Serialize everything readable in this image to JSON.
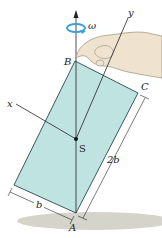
{
  "figure": {
    "labels": {
      "omega": "ω",
      "y_axis": "y",
      "x_axis": "x",
      "point_B": "B",
      "point_C": "C",
      "point_S": "S",
      "point_A": "A",
      "dim_short": "b",
      "dim_long": "2b"
    },
    "colors": {
      "plate_fill": "#bfe3e0",
      "plate_edge": "#3a5a5a",
      "shadow": "#c9c9bd",
      "hand": "#efe3cf",
      "rotation_arrow": "#3b9fd6",
      "line": "#222222"
    }
  }
}
